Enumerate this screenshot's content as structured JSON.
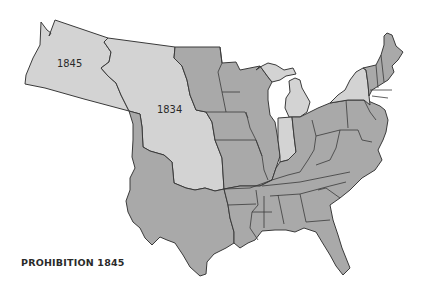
{
  "caption": "PROHIBITION 1845",
  "colors": {
    "prohibition": "#a9a9a9",
    "non_prohibition": "#d3d3d3",
    "border": "#3a3a3a",
    "background": "#ffffff"
  },
  "regions": [
    {
      "id": "oregon-territory",
      "label": "1845",
      "status": "non_prohibition"
    },
    {
      "id": "unorganized-territory",
      "label": "1834",
      "status": "non_prohibition"
    },
    {
      "id": "michigan",
      "status": "non_prohibition"
    },
    {
      "id": "indiana",
      "status": "non_prohibition"
    },
    {
      "id": "new-york",
      "status": "non_prohibition"
    },
    {
      "id": "other-states",
      "status": "prohibition"
    }
  ]
}
